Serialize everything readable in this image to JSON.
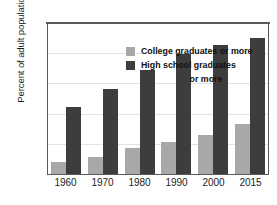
{
  "chart_data": {
    "type": "bar",
    "title": "",
    "xlabel": "",
    "ylabel": "Percent of adult population",
    "categories": [
      "1960",
      "1970",
      "1980",
      "1990",
      "2000",
      "2015"
    ],
    "series": [
      {
        "name": "College graduates or more",
        "color": "#a8a8a8",
        "values": [
          8,
          11,
          17,
          21,
          26,
          33
        ]
      },
      {
        "name": "High school graduates or more",
        "color": "#3d3d3d",
        "values": [
          44,
          56,
          69,
          79,
          85,
          90
        ]
      }
    ],
    "ylim": [
      0,
      100
    ],
    "yticks": [
      0,
      20,
      40,
      60,
      80,
      100
    ],
    "ytick_labels": [
      "0",
      "20",
      "40",
      "60",
      "80",
      "100"
    ],
    "grid": true,
    "legend_position": "top-center-inside"
  },
  "legend": {
    "entries": [
      {
        "label": "College graduates or more",
        "label_line1": "College graduates or more",
        "label_line2": ""
      },
      {
        "label": "High school graduates or more",
        "label_line1": "High school graduates",
        "label_line2": "or more"
      }
    ]
  },
  "axes": {
    "y_title": "Percent of adult population"
  }
}
